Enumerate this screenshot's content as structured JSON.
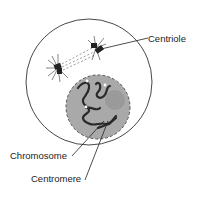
{
  "diagram": {
    "type": "cell-diagram",
    "labels": {
      "centriole": "Centriole",
      "chromosome": "Chromosome",
      "centromere": "Centromere"
    },
    "colors": {
      "background": "#ffffff",
      "cell_outline": "#333333",
      "nucleus_fill": "#a9a9a9",
      "nucleus_outline": "#555555",
      "chromosome": "#2a2a2a",
      "text": "#222222"
    }
  }
}
